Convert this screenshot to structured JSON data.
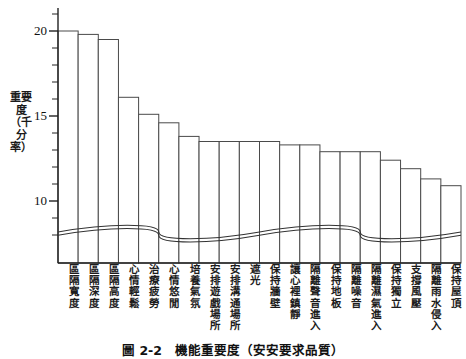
{
  "chart_data": {
    "type": "bar",
    "title": "機能重要度（安安要求品質）",
    "xlabel": "",
    "ylabel": "重要度\n（千分率）",
    "ylim": [
      8,
      21
    ],
    "yticks_labeled": [
      10,
      15,
      20
    ],
    "ytick_step_minor": 1,
    "grid": false,
    "legend": null,
    "axis_break": true,
    "categories": [
      "區隔寬度",
      "區隔深度",
      "區隔高度",
      "心情輕鬆",
      "治療疲勞",
      "心情悠閒",
      "培養氣氛",
      "安排遊戲場所",
      "安排溝通場所",
      "遮光",
      "保持牆壁",
      "讓心裡鎮靜",
      "隔離聲音進入",
      "保持地板",
      "隔離噪音",
      "隔離濕氣進入",
      "保持獨立",
      "支撐風壓",
      "隔離雨水侵入",
      "保持屋頂"
    ],
    "values": [
      20.0,
      19.8,
      19.5,
      16.1,
      15.1,
      14.6,
      13.8,
      13.5,
      13.5,
      13.5,
      13.5,
      13.3,
      13.3,
      12.9,
      12.9,
      12.9,
      12.4,
      11.9,
      11.3,
      10.9
    ]
  },
  "axis": {
    "tick_labels": [
      "20",
      "15",
      "10"
    ],
    "unit_note": "千分率"
  },
  "caption": {
    "number": "圖 2-2",
    "text": "機能重要度（安安要求品質）",
    "full": "圖 2-2　機能重要度（安安要求品質）"
  }
}
